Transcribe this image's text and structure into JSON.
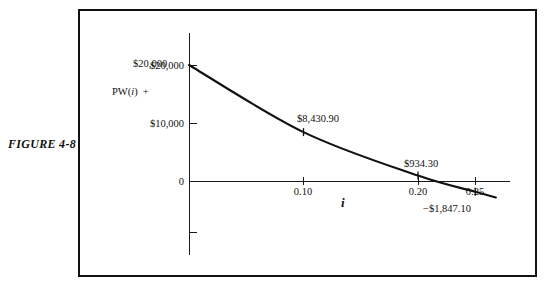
{
  "figure": {
    "caption": "FIGURE 4-8"
  },
  "axes": {
    "y_axis_title_prefix": "PW(",
    "y_axis_title_var": "i",
    "y_axis_title_suffix": ")",
    "y_axis_title_sign": "+",
    "x_axis_title": "i"
  },
  "chart_data": {
    "type": "line",
    "title": "FIGURE 4-8",
    "xlabel": "i",
    "ylabel": "PW(i)",
    "grid": false,
    "legend": null,
    "xlim": [
      0,
      0.282
    ],
    "ylim": [
      -12000,
      24000
    ],
    "x_ticks": [
      {
        "value": 0.1,
        "label": "0.10"
      },
      {
        "value": 0.2,
        "label": "0.20"
      },
      {
        "value": 0.25,
        "label": "0.25"
      }
    ],
    "y_ticks": [
      {
        "value": 20000,
        "label": "$20,000"
      },
      {
        "value": 10000,
        "label": "$10,000"
      },
      {
        "value": 0,
        "label": "0"
      },
      {
        "value": -8900,
        "label": ""
      }
    ],
    "series": [
      {
        "name": "PW(i)",
        "x": [
          0.0,
          0.1,
          0.2,
          0.25,
          0.268
        ],
        "values": [
          20000,
          8430.9,
          934.3,
          -1847.1,
          -2830
        ]
      }
    ],
    "annotations": [
      {
        "text": "$20,000",
        "x": 0.0,
        "y": 20000
      },
      {
        "text": "$8,430.90",
        "x": 0.1,
        "y": 8430.9
      },
      {
        "text": "$934.30",
        "x": 0.2,
        "y": 934.3
      },
      {
        "text": "−$1,847.10",
        "x": 0.25,
        "y": -1847.1
      }
    ],
    "colors": {
      "curve": "#111111",
      "axis": "#1a1a1a",
      "border": "#111111",
      "background": "#ffffff"
    }
  }
}
